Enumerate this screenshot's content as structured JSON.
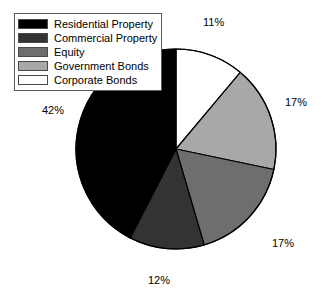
{
  "chart_data": {
    "type": "pie",
    "title": "",
    "legend_position": "top-left",
    "start_angle_clock": 12,
    "direction": "clockwise",
    "categories": [
      "Residential Property",
      "Commercial Property",
      "Equity",
      "Government Bonds",
      "Corporate Bonds"
    ],
    "values": [
      42,
      12,
      17,
      17,
      11
    ],
    "value_labels": [
      "42%",
      "12%",
      "17%",
      "17%",
      "11%"
    ],
    "colors": [
      "#000000",
      "#333333",
      "#6e6e6e",
      "#a8a8a8",
      "#ffffff"
    ],
    "slices": [
      {
        "label": "Corporate Bonds",
        "value": 11,
        "value_label": "11%",
        "color": "#ffffff"
      },
      {
        "label": "Government Bonds",
        "value": 17,
        "value_label": "17%",
        "color": "#a8a8a8"
      },
      {
        "label": "Equity",
        "value": 17,
        "value_label": "17%",
        "color": "#6e6e6e"
      },
      {
        "label": "Commercial Property",
        "value": 12,
        "value_label": "12%",
        "color": "#333333"
      },
      {
        "label": "Residential Property",
        "value": 42,
        "value_label": "42%",
        "color": "#000000"
      }
    ]
  },
  "legend": {
    "items": [
      {
        "label": "Residential Property",
        "color": "#000000"
      },
      {
        "label": "Commercial Property",
        "color": "#333333"
      },
      {
        "label": "Equity",
        "color": "#6e6e6e"
      },
      {
        "label": "Government Bonds",
        "color": "#a8a8a8"
      },
      {
        "label": "Corporate Bonds",
        "color": "#ffffff"
      }
    ]
  },
  "callouts": {
    "corporate_bonds": "11%",
    "government_bonds": "17%",
    "equity": "17%",
    "commercial_property": "12%",
    "residential_property": "42%"
  },
  "geometry": {
    "center_x": 176,
    "center_y": 149,
    "radius": 100,
    "outline_color": "#000000"
  }
}
